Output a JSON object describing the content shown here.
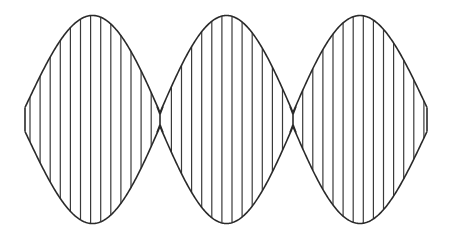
{
  "figure": {
    "canvas": {
      "width": 459,
      "height": 239
    },
    "stroke_color": "#2a2a2a",
    "hatch_color": "#3a3a3a",
    "background": "#ffffff",
    "outline_width": 1.6,
    "hatch_width": 1.2,
    "center_y": 119.5,
    "left_x": 25,
    "right_x": 427,
    "pinch_x": [
      160,
      293
    ],
    "pinch_half_height": 7,
    "end_half_height": 12,
    "peak_half_height": 104,
    "hatch_spacing": 10.1,
    "hatch_start_x": 30
  }
}
